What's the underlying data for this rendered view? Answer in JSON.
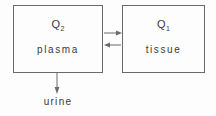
{
  "diagram": {
    "stroke_color": "#6a6a6a",
    "text_color": "#3a3a3a",
    "background_color": "#fdfdfd",
    "compartments": [
      {
        "id": "plasma",
        "quantity_symbol": "Q",
        "quantity_subscript": "2",
        "name": "plasma"
      },
      {
        "id": "tissue",
        "quantity_symbol": "Q",
        "quantity_subscript": "1",
        "name": "tissue"
      }
    ],
    "flows": [
      {
        "id": "plasma-to-tissue",
        "direction": "right"
      },
      {
        "id": "tissue-to-plasma",
        "direction": "left"
      },
      {
        "id": "plasma-to-urine",
        "direction": "down",
        "label": "urine"
      }
    ],
    "output_label": "urine"
  }
}
